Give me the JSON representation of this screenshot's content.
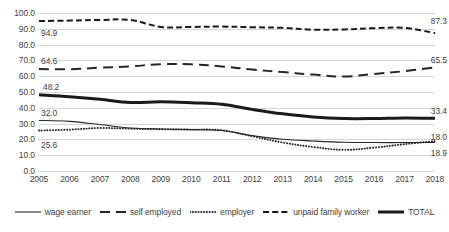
{
  "chart_data": {
    "type": "line",
    "title": "",
    "xlabel": "",
    "ylabel": "",
    "x": [
      2005,
      2006,
      2007,
      2008,
      2009,
      2010,
      2011,
      2012,
      2013,
      2014,
      2015,
      2016,
      2017,
      2018
    ],
    "categories": [
      "2005",
      "2006",
      "2007",
      "2008",
      "2009",
      "2010",
      "2011",
      "2012",
      "2013",
      "2014",
      "2015",
      "2016",
      "2017",
      "2018"
    ],
    "xlim": [
      2005,
      2018
    ],
    "ylim": [
      0,
      100
    ],
    "y_ticks": [
      "0.0",
      "10.0",
      "20.0",
      "30.0",
      "40.0",
      "50.0",
      "60.0",
      "70.0",
      "80.0",
      "90.0",
      "100.0"
    ],
    "y_tick_values": [
      0,
      10,
      20,
      30,
      40,
      50,
      60,
      70,
      80,
      90,
      100
    ],
    "grid": true,
    "legend_position": "bottom",
    "series": [
      {
        "name": "wage earner",
        "style": "solid-thin",
        "color": "#262626",
        "values": [
          32.0,
          31.4,
          29.4,
          27.2,
          26.6,
          26.2,
          25.6,
          22.4,
          20.1,
          19.0,
          18.2,
          18.0,
          18.0,
          18.0
        ]
      },
      {
        "name": "self employed",
        "style": "long-dash",
        "color": "#262626",
        "values": [
          64.6,
          64.4,
          65.4,
          66.2,
          67.6,
          67.5,
          66.2,
          64.2,
          62.6,
          61.0,
          59.8,
          61.4,
          63.2,
          65.5
        ]
      },
      {
        "name": "employer",
        "style": "dotted",
        "color": "#262626",
        "values": [
          25.6,
          26.2,
          27.2,
          26.8,
          26.4,
          26.2,
          25.8,
          22.0,
          18.0,
          15.2,
          13.4,
          14.8,
          17.0,
          18.9
        ]
      },
      {
        "name": "unpaid family worker",
        "style": "dash",
        "color": "#1a1a1a",
        "values": [
          94.9,
          95.2,
          95.6,
          95.6,
          91.2,
          91.2,
          91.4,
          91.0,
          90.6,
          89.4,
          89.6,
          90.4,
          90.6,
          87.3
        ]
      },
      {
        "name": "TOTAL",
        "style": "solid-thick",
        "color": "#1a1a1a",
        "values": [
          48.2,
          47.0,
          45.4,
          43.4,
          43.8,
          43.2,
          42.2,
          39.0,
          36.2,
          34.2,
          33.2,
          33.2,
          33.6,
          33.4
        ]
      }
    ],
    "annotations": [
      {
        "id": "wage-earner-start",
        "text": "32.0",
        "value": 32.0,
        "x": 2005,
        "series": "wage earner",
        "align": "left"
      },
      {
        "id": "self-employed-start",
        "text": "64.6",
        "value": 64.6,
        "x": 2005,
        "series": "self employed",
        "align": "left"
      },
      {
        "id": "employer-start",
        "text": "25.6",
        "value": 25.6,
        "x": 2005,
        "series": "employer",
        "align": "left"
      },
      {
        "id": "unpaid-family-worker-start",
        "text": "94.9",
        "value": 94.9,
        "x": 2005,
        "series": "unpaid family worker",
        "align": "left"
      },
      {
        "id": "total-start",
        "text": "48.2",
        "value": 48.2,
        "x": 2005,
        "series": "TOTAL",
        "align": "left"
      },
      {
        "id": "wage-earner-end",
        "text": "18.0",
        "value": 18.0,
        "x": 2018,
        "series": "wage earner",
        "align": "right"
      },
      {
        "id": "self-employed-end",
        "text": "65.5",
        "value": 65.5,
        "x": 2018,
        "series": "self employed",
        "align": "right"
      },
      {
        "id": "employer-end",
        "text": "18.9",
        "value": 18.9,
        "x": 2018,
        "series": "employer",
        "align": "right"
      },
      {
        "id": "unpaid-family-worker-end",
        "text": "87.3",
        "value": 87.3,
        "x": 2018,
        "series": "unpaid family worker",
        "align": "right"
      },
      {
        "id": "total-end",
        "text": "33.4",
        "value": 33.4,
        "x": 2018,
        "series": "TOTAL",
        "align": "right"
      }
    ]
  },
  "legend": {
    "items": [
      {
        "label": "wage earner"
      },
      {
        "label": "self employed"
      },
      {
        "label": "employer"
      },
      {
        "label": "unpaid family worker"
      },
      {
        "label": "TOTAL"
      }
    ]
  },
  "colors": {
    "gridline": "#d6d6d6",
    "text": "#3f3f3f",
    "line": "#262626"
  }
}
